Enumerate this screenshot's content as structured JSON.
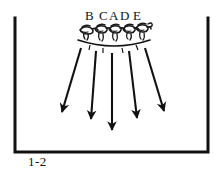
{
  "figure": {
    "caption": "1-2",
    "frame": {
      "color": "#111111",
      "left_x": 15,
      "right_x": 208,
      "top_y": 18,
      "bottom_y": 152,
      "stroke_width": 3,
      "has_top_border": false
    },
    "labels": [
      {
        "text": "B",
        "x": 86,
        "y": 10
      },
      {
        "text": "C",
        "x": 100,
        "y": 10
      },
      {
        "text": "A",
        "x": 110,
        "y": 10
      },
      {
        "text": "D",
        "x": 121,
        "y": 10
      },
      {
        "text": "E",
        "x": 133,
        "y": 10
      }
    ],
    "arc": {
      "color": "#111111",
      "start_x": 78,
      "start_y": 41,
      "end_x": 150,
      "end_y": 41,
      "apex_y": 48,
      "stroke_width": 1.6
    },
    "figures_label": "scribbled bird cluster",
    "figure_count": 5,
    "arrows": {
      "color": "#111111",
      "stroke_width": 2.2,
      "items": [
        {
          "x1": 81,
          "y1": 48,
          "x2": 62,
          "y2": 114
        },
        {
          "x1": 96,
          "y1": 50,
          "x2": 91,
          "y2": 122
        },
        {
          "x1": 112,
          "y1": 52,
          "x2": 112,
          "y2": 133
        },
        {
          "x1": 129,
          "y1": 50,
          "x2": 137,
          "y2": 121
        },
        {
          "x1": 145,
          "y1": 48,
          "x2": 164,
          "y2": 113
        }
      ]
    },
    "tick_marks": {
      "color": "#111111",
      "count": 4
    }
  }
}
